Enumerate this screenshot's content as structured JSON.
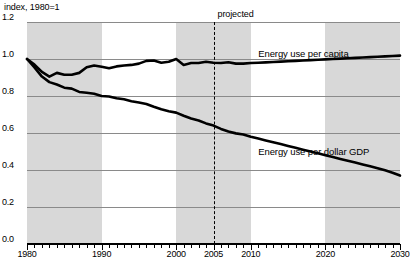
{
  "chart_data": {
    "type": "line",
    "title": "",
    "unit_label": "index, 1980=1",
    "xlabel": "",
    "ylabel": "",
    "xlim": [
      1980,
      2030
    ],
    "ylim": [
      0.0,
      1.2
    ],
    "grid": true,
    "legend": "inline-labels",
    "yticks": [
      "0.0",
      "0.2",
      "0.4",
      "0.6",
      "0.8",
      "1.0",
      "1.2"
    ],
    "ytick_values": [
      0.0,
      0.2,
      0.4,
      0.6,
      0.8,
      1.0,
      1.2
    ],
    "xticks": [
      "1980",
      "1990",
      "2000",
      "2005",
      "2010",
      "2020",
      "2030"
    ],
    "xtick_values": [
      1980,
      1990,
      2000,
      2005,
      2010,
      2020,
      2030
    ],
    "minor_tick_interval": 1,
    "annotations": [
      {
        "name": "projected-divider",
        "label": "projected",
        "x": 2005,
        "style": "dashed-vertical-line"
      }
    ],
    "shaded_bands": [
      {
        "x0": 1980,
        "x1": 1990
      },
      {
        "x0": 2000,
        "x1": 2010
      },
      {
        "x0": 2020,
        "x1": 2030
      }
    ],
    "x": [
      1980,
      1981,
      1982,
      1983,
      1984,
      1985,
      1986,
      1987,
      1988,
      1989,
      1990,
      1991,
      1992,
      1993,
      1994,
      1995,
      1996,
      1997,
      1998,
      1999,
      2000,
      2001,
      2002,
      2003,
      2004,
      2005,
      2006,
      2007,
      2008,
      2009,
      2010,
      2011,
      2012,
      2013,
      2014,
      2015,
      2016,
      2017,
      2018,
      2019,
      2020,
      2021,
      2022,
      2023,
      2024,
      2025,
      2026,
      2027,
      2028,
      2029,
      2030
    ],
    "series": [
      {
        "name": "Energy use per capita",
        "label": "Energy use per capita",
        "color": "#000000",
        "values": [
          1.0,
          0.97,
          0.93,
          0.905,
          0.925,
          0.915,
          0.915,
          0.925,
          0.955,
          0.965,
          0.958,
          0.95,
          0.96,
          0.965,
          0.968,
          0.975,
          0.99,
          0.992,
          0.98,
          0.985,
          1.0,
          0.968,
          0.978,
          0.978,
          0.985,
          0.98,
          0.978,
          0.982,
          0.975,
          0.975,
          0.978,
          0.98,
          0.982,
          0.984,
          0.986,
          0.988,
          0.99,
          0.992,
          0.994,
          0.996,
          0.998,
          1.0,
          1.002,
          1.004,
          1.006,
          1.008,
          1.01,
          1.012,
          1.014,
          1.016,
          1.018
        ]
      },
      {
        "name": "Energy use per dollar GDP",
        "label": "Energy use per dollar GDP",
        "color": "#000000",
        "values": [
          1.0,
          0.955,
          0.905,
          0.875,
          0.862,
          0.845,
          0.84,
          0.822,
          0.818,
          0.812,
          0.8,
          0.797,
          0.788,
          0.782,
          0.772,
          0.765,
          0.757,
          0.742,
          0.728,
          0.718,
          0.71,
          0.693,
          0.678,
          0.668,
          0.652,
          0.64,
          0.622,
          0.608,
          0.598,
          0.592,
          0.58,
          0.57,
          0.56,
          0.55,
          0.54,
          0.53,
          0.52,
          0.51,
          0.5,
          0.49,
          0.48,
          0.47,
          0.46,
          0.45,
          0.44,
          0.43,
          0.42,
          0.41,
          0.398,
          0.385,
          0.37
        ]
      }
    ]
  },
  "footer": {
    "note": ""
  }
}
